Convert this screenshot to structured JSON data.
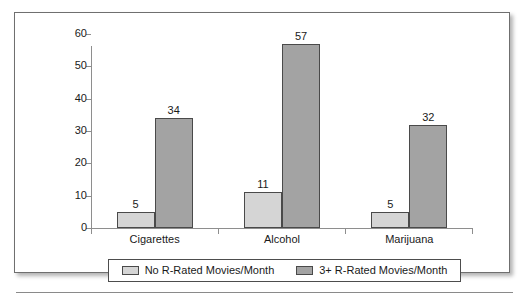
{
  "chart_data": {
    "type": "bar",
    "title": "",
    "xlabel": "",
    "ylabel": "",
    "categories": [
      "Cigarettes",
      "Alcohol",
      "Marijuana"
    ],
    "series": [
      {
        "name": "No R-Rated Movies/Month",
        "values": [
          5,
          11,
          5
        ],
        "color": "#d5d5d5"
      },
      {
        "name": "3+ R-Rated Movies/Month",
        "values": [
          34,
          57,
          32
        ],
        "color": "#a3a3a3"
      }
    ],
    "ylim": [
      0,
      60
    ],
    "yticks": [
      0,
      10,
      20,
      30,
      40,
      50,
      60
    ],
    "ytick_labels": [
      "0",
      "10",
      "20",
      "30",
      "40",
      "50",
      "60"
    ],
    "grid": false,
    "legend_position": "bottom",
    "data_labels": [
      "5",
      "34",
      "11",
      "57",
      "5",
      "32"
    ]
  },
  "legend": {
    "items": [
      {
        "label": "No R-Rated Movies/Month",
        "swatch": "light"
      },
      {
        "label": "3+ R-Rated Movies/Month",
        "swatch": "dark"
      }
    ]
  }
}
